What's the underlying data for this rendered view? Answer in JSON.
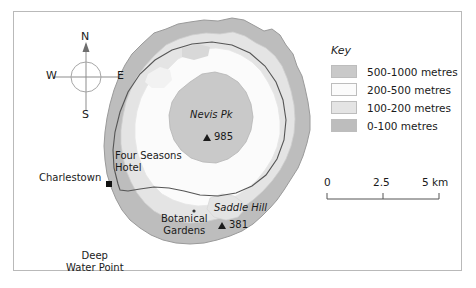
{
  "map": {
    "title": "Nevis island relief map",
    "frame_border_color": "#b9b9b9",
    "background": "#ffffff",
    "sea_color": "#ffffff",
    "coast_outline_color": "#9a9a9a",
    "road_color": "#555555"
  },
  "compass": {
    "north": "N",
    "south": "S",
    "west": "W",
    "east": "E",
    "ring_color": "#9a9a9a",
    "needle_color": "#666666"
  },
  "key": {
    "title": "Key",
    "entries": [
      {
        "label": "500-1000 metres",
        "color": "#c9c9c9"
      },
      {
        "label": "200-500 metres",
        "color": "#fbfbfb"
      },
      {
        "label": "100-200 metres",
        "color": "#e4e4e4"
      },
      {
        "label": "0-100 metres",
        "color": "#bdbdbd"
      }
    ]
  },
  "scale": {
    "ticks": [
      "0",
      "2.5",
      "5 km"
    ],
    "unit": "km",
    "max_value": 5,
    "line_color": "#555555"
  },
  "labels": {
    "charlestown": "Charlestown",
    "four_seasons_line1": "Four Seasons",
    "four_seasons_line2": "Hotel",
    "deep_water_line1": "Deep",
    "deep_water_line2": "Water Point",
    "nevis_peak_name": "Nevis Pk",
    "nevis_peak_elevation": "985",
    "saddle_hill_name": "Saddle Hill",
    "saddle_hill_elevation": "381",
    "botanical_line1": "Botanical",
    "botanical_line2": "Gardens"
  }
}
